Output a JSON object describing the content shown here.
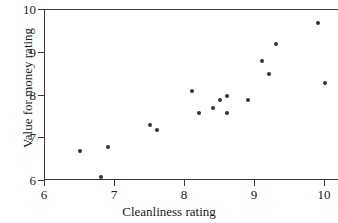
{
  "chart_data": {
    "type": "scatter",
    "title": "",
    "xlabel": "Cleanliness rating",
    "ylabel": "Value for money rating",
    "xlim": [
      6,
      10.2
    ],
    "ylim": [
      6,
      10
    ],
    "xticks": [
      6,
      7,
      8,
      9,
      10
    ],
    "yticks": [
      6,
      7,
      8,
      9,
      10
    ],
    "xtick_labels": [
      "6",
      "7",
      "8",
      "9",
      "10"
    ],
    "ytick_labels": [
      "6",
      "7",
      "8",
      "9",
      "10"
    ],
    "grid": false,
    "legend": null,
    "marker": {
      "shape": "circle",
      "color": "#333333",
      "size": 4
    },
    "points": [
      {
        "x": 6.5,
        "y": 6.7
      },
      {
        "x": 6.8,
        "y": 6.1
      },
      {
        "x": 6.9,
        "y": 6.8
      },
      {
        "x": 7.5,
        "y": 7.3
      },
      {
        "x": 7.6,
        "y": 7.2
      },
      {
        "x": 8.1,
        "y": 8.1
      },
      {
        "x": 8.2,
        "y": 7.6
      },
      {
        "x": 8.4,
        "y": 7.7
      },
      {
        "x": 8.5,
        "y": 7.9
      },
      {
        "x": 8.6,
        "y": 8.0
      },
      {
        "x": 8.6,
        "y": 7.6
      },
      {
        "x": 8.9,
        "y": 7.9
      },
      {
        "x": 9.1,
        "y": 8.8
      },
      {
        "x": 9.2,
        "y": 8.5
      },
      {
        "x": 9.3,
        "y": 9.2
      },
      {
        "x": 9.9,
        "y": 9.7
      },
      {
        "x": 10.0,
        "y": 8.3
      }
    ]
  }
}
